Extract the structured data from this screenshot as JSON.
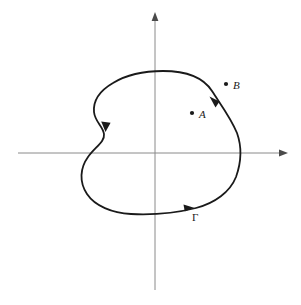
{
  "figure": {
    "background_color": "#ffffff",
    "width": 301,
    "height": 305
  },
  "axes": {
    "color": "#8a8a8a",
    "stroke_width": 1,
    "origin": {
      "x": 155,
      "y": 153
    },
    "horizontal": {
      "name": "real-axis",
      "x_start": 18,
      "x_end": 288,
      "y": 153,
      "arrow_at": "end"
    },
    "vertical": {
      "name": "imaginary-axis",
      "x": 155,
      "y_start": 290,
      "y_end": 12,
      "arrow_at": "end"
    }
  },
  "curve": {
    "name": "Gamma",
    "label": "Γ",
    "label_position": {
      "x": 192,
      "y": 212
    },
    "color": "#1a1a1a",
    "stroke_width": 1.8,
    "closed": true,
    "orientation": "counterclockwise",
    "extents": {
      "top_y": 71,
      "bottom_y": 216,
      "left_x": 95,
      "right_x": 240,
      "notch_x": 104,
      "notch_y": 135
    },
    "direction_arrows": [
      {
        "name": "arrow-left-notch",
        "x": 106,
        "y": 128,
        "angle_deg": 100
      },
      {
        "name": "arrow-upper-right",
        "x": 213,
        "y": 100,
        "angle_deg": -118
      },
      {
        "name": "arrow-bottom",
        "x": 191,
        "y": 207,
        "angle_deg": -15
      }
    ]
  },
  "points": [
    {
      "name": "point-A",
      "label": "A",
      "dot": {
        "x": 192,
        "y": 113
      },
      "label_position": {
        "x": 199,
        "y": 110
      },
      "dot_radius": 2.1,
      "color": "#1a1a1a"
    },
    {
      "name": "point-B",
      "label": "B",
      "dot": {
        "x": 226,
        "y": 84
      },
      "label_position": {
        "x": 233,
        "y": 81
      },
      "dot_radius": 2.1,
      "color": "#1a1a1a"
    }
  ]
}
